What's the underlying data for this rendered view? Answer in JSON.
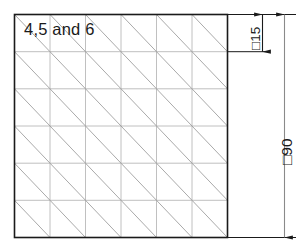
{
  "drawing": {
    "type": "engineering-hatch-detail",
    "part_label": "4,5 and 6",
    "square": {
      "overall_dimension_label": "□90",
      "cell_dimension_label": "□15",
      "overall_size_mm": 90,
      "cell_size_mm": 15,
      "columns": 6,
      "rows": 6,
      "diagonal_direction": "top-left-to-bottom-right"
    },
    "dimensions": [
      {
        "name": "cell-dimension",
        "label": "□15",
        "value": 15,
        "symbol": "square",
        "orientation": "vertical",
        "spans": "one grid cell"
      },
      {
        "name": "overall-dimension",
        "label": "□90",
        "value": 90,
        "symbol": "square",
        "orientation": "vertical",
        "spans": "full part height"
      }
    ],
    "colors": {
      "outline": "#1a1a1a",
      "grid": "#b9b9b9",
      "diagonal": "#9a9a9a",
      "dimension": "#1a1a1a",
      "background": "#ffffff"
    }
  }
}
